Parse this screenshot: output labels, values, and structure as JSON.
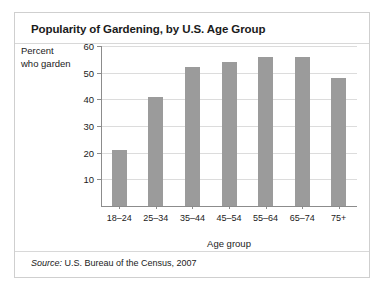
{
  "chart_data": {
    "type": "bar",
    "title": "Popularity of Gardening, by U.S. Age Group",
    "categories": [
      "18–24",
      "25–34",
      "35–44",
      "45–54",
      "55–64",
      "65–74",
      "75+"
    ],
    "values": [
      21,
      41,
      52,
      54,
      56,
      56,
      48
    ],
    "xlabel": "Age group",
    "ylabel_line1": "Percent",
    "ylabel_line2": "who garden",
    "ylim": [
      0,
      60
    ],
    "yticks": [
      60,
      50,
      40,
      30,
      20,
      10
    ],
    "grid": true,
    "legend": "none",
    "bar_color": "#9b9b9b",
    "gridline_color": "#dcdcdc",
    "axis_color": "#8c8c8c"
  },
  "source": {
    "label": "Source:",
    "text": " U.S. Bureau of the Census, 2007"
  }
}
